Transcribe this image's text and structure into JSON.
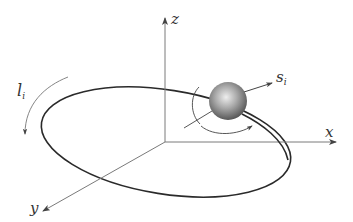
{
  "figure": {
    "type": "orbit-spin-diagram",
    "labels": {
      "z_axis": "z",
      "x_axis": "x",
      "y_axis": "y",
      "orbital_label_main": "l",
      "orbital_label_sub": "i",
      "spin_label_main": "s",
      "spin_label_sub": "i"
    },
    "colors": {
      "axis": "#7a7a7a",
      "orbit": "#2a2a2a",
      "label": "#333333",
      "sphere_light": "#e8e8e8",
      "sphere_mid": "#9a9a9a",
      "sphere_dark": "#4a4a4a"
    },
    "elements": [
      "z-axis",
      "x-axis",
      "y-axis",
      "orbit-ellipse",
      "particle-sphere",
      "spin-vector",
      "spin-rotation-arc",
      "orbital-motion-arc"
    ]
  }
}
